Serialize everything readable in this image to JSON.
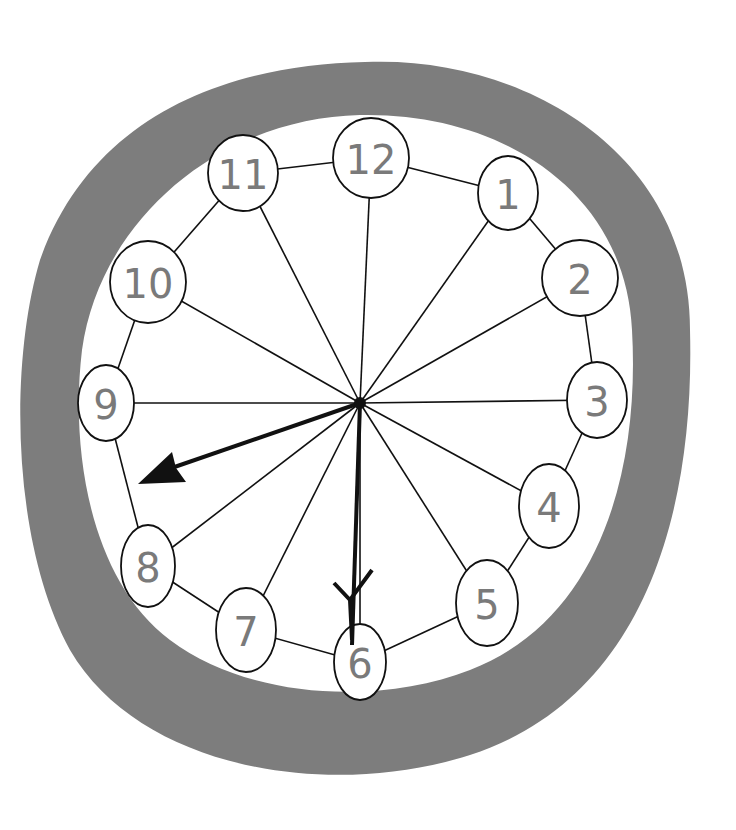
{
  "drawing": {
    "subject": "hand-drawn clock",
    "ring_color": "#7d7d7d",
    "face_color": "#ffffff",
    "line_color": "#111111",
    "numeral_color": "#7a7a7a",
    "numerals": [
      {
        "label": "12",
        "x": 371,
        "y": 158,
        "rx": 38,
        "ry": 40
      },
      {
        "label": "1",
        "x": 508,
        "y": 193,
        "rx": 30,
        "ry": 37
      },
      {
        "label": "2",
        "x": 580,
        "y": 278,
        "rx": 38,
        "ry": 38
      },
      {
        "label": "3",
        "x": 597,
        "y": 400,
        "rx": 30,
        "ry": 38
      },
      {
        "label": "4",
        "x": 549,
        "y": 506,
        "rx": 30,
        "ry": 42
      },
      {
        "label": "5",
        "x": 487,
        "y": 603,
        "rx": 31,
        "ry": 43
      },
      {
        "label": "6",
        "x": 360,
        "y": 662,
        "rx": 26,
        "ry": 38
      },
      {
        "label": "7",
        "x": 246,
        "y": 630,
        "rx": 30,
        "ry": 42
      },
      {
        "label": "8",
        "x": 148,
        "y": 566,
        "rx": 27,
        "ry": 41
      },
      {
        "label": "9",
        "x": 106,
        "y": 403,
        "rx": 28,
        "ry": 38
      },
      {
        "label": "10",
        "x": 148,
        "y": 282,
        "rx": 38,
        "ry": 41
      },
      {
        "label": "11",
        "x": 243,
        "y": 173,
        "rx": 35,
        "ry": 38
      }
    ],
    "center": {
      "x": 360,
      "y": 403
    },
    "hands": {
      "hour_tip": {
        "x": 140,
        "y": 483
      },
      "minute_tip": {
        "x": 352,
        "y": 640
      }
    },
    "time_shown": "8:30"
  }
}
